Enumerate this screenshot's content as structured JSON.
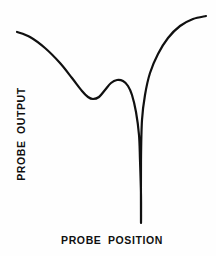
{
  "figure": {
    "background_color": "#fefefe",
    "line_color": "#101010",
    "x_axis_label": "PROBE POSITION",
    "y_axis_label": "PROBE OUTPUT"
  },
  "chart_data": {
    "type": "line",
    "title": "",
    "xlabel": "PROBE POSITION",
    "ylabel": "PROBE OUTPUT",
    "grid": false,
    "legend": false,
    "axes_drawn": false,
    "tick_labels": {
      "x": [],
      "y": []
    },
    "xlim": [
      0,
      216
    ],
    "ylim": [
      0,
      256
    ],
    "annotations": [],
    "series": [
      {
        "name": "probe response",
        "color": "#101010",
        "line_width": 2.2,
        "points": [
          {
            "x": 17,
            "y": 32,
            "feature": "left-endpoint"
          },
          {
            "x": 30,
            "y": 37,
            "feature": ""
          },
          {
            "x": 45,
            "y": 48,
            "feature": ""
          },
          {
            "x": 60,
            "y": 63,
            "feature": ""
          },
          {
            "x": 72,
            "y": 78,
            "feature": ""
          },
          {
            "x": 82,
            "y": 91,
            "feature": ""
          },
          {
            "x": 88,
            "y": 97,
            "feature": ""
          },
          {
            "x": 93,
            "y": 99,
            "feature": "local-minimum"
          },
          {
            "x": 99,
            "y": 97,
            "feature": ""
          },
          {
            "x": 105,
            "y": 90,
            "feature": ""
          },
          {
            "x": 111,
            "y": 83,
            "feature": ""
          },
          {
            "x": 117,
            "y": 80,
            "feature": "local-maximum-bump"
          },
          {
            "x": 123,
            "y": 81,
            "feature": ""
          },
          {
            "x": 128,
            "y": 86,
            "feature": ""
          },
          {
            "x": 132,
            "y": 95,
            "feature": ""
          },
          {
            "x": 136,
            "y": 112,
            "feature": ""
          },
          {
            "x": 139,
            "y": 135,
            "feature": ""
          },
          {
            "x": 140,
            "y": 160,
            "feature": "notch-descent"
          },
          {
            "x": 141,
            "y": 195,
            "feature": ""
          },
          {
            "x": 141,
            "y": 222,
            "feature": "notch-bottom"
          },
          {
            "x": 141,
            "y": 160,
            "feature": "notch-ascent"
          },
          {
            "x": 142,
            "y": 120,
            "feature": ""
          },
          {
            "x": 145,
            "y": 95,
            "feature": ""
          },
          {
            "x": 150,
            "y": 73,
            "feature": ""
          },
          {
            "x": 158,
            "y": 54,
            "feature": ""
          },
          {
            "x": 168,
            "y": 38,
            "feature": ""
          },
          {
            "x": 180,
            "y": 26,
            "feature": ""
          },
          {
            "x": 193,
            "y": 19,
            "feature": ""
          },
          {
            "x": 206,
            "y": 16,
            "feature": "right-endpoint"
          }
        ]
      }
    ]
  }
}
